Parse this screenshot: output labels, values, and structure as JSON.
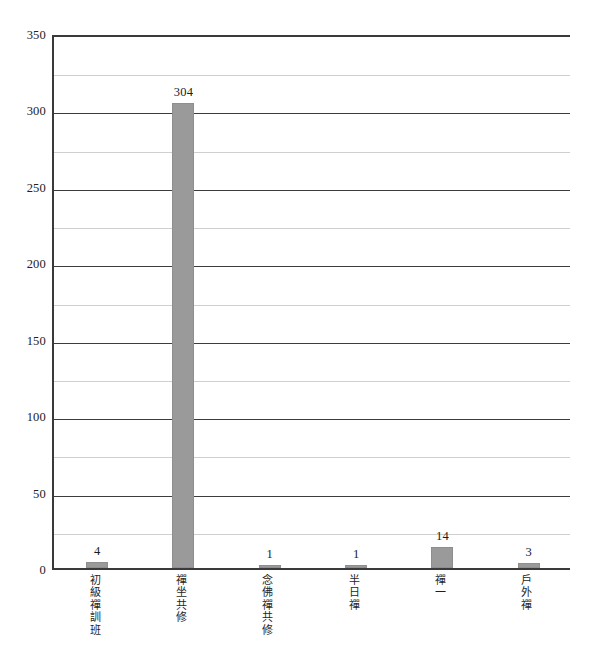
{
  "chart_data": {
    "type": "bar",
    "title": "",
    "subtitle": "",
    "xlabel": "",
    "ylabel": "",
    "categories": [
      "初級禪訓班",
      "禪坐共修",
      "念佛禪共修",
      "半日禪",
      "禪一",
      "戶外禪"
    ],
    "values": [
      4,
      304,
      1,
      1,
      14,
      3
    ],
    "value_labels": [
      "4",
      "304",
      "1",
      "1",
      "14",
      "3"
    ],
    "ylim": [
      0,
      350
    ],
    "y_ticks": [
      0,
      50,
      100,
      150,
      200,
      250,
      300,
      350
    ],
    "y_tick_labels": [
      "0",
      "50",
      "100",
      "150",
      "200",
      "250",
      "300",
      "350"
    ],
    "y_minor_ticks": [
      25,
      75,
      125,
      175,
      225,
      275,
      325
    ],
    "grid": "horizontal",
    "legend": "none",
    "series": [
      {
        "name": "count",
        "values": [
          4,
          304,
          1,
          1,
          14,
          3
        ]
      }
    ]
  },
  "style": {
    "bar_color": "#9a9a9a",
    "bar_edge_color": "#8e8e8e",
    "major_gridline_color": "#3c3c3c",
    "minor_gridline_color": "#cfcfcf",
    "axis_color": "#3a3a3a",
    "background": "#ffffff",
    "text_color": "#1a1a1a"
  }
}
